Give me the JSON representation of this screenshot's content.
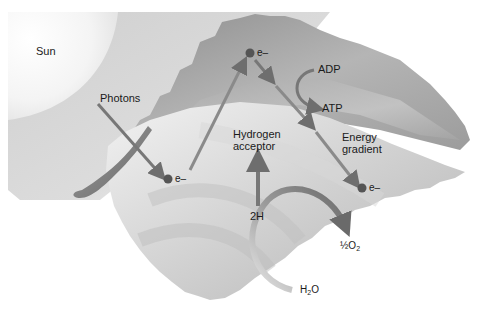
{
  "diagram": {
    "labels": {
      "sun": "Sun",
      "photons": "Photons",
      "electron": "e–",
      "adp": "ADP",
      "atp": "ATP",
      "hydrogen_acceptor_line1": "Hydrogen",
      "hydrogen_acceptor_line2": "acceptor",
      "energy_gradient_line1": "Energy",
      "energy_gradient_line2": "gradient",
      "two_h": "2H",
      "half_o2_prefix": "½O",
      "half_o2_sub": "2",
      "h2o_prefix": "H",
      "h2o_sub": "2",
      "h2o_suffix": "O"
    },
    "electrons": [
      {
        "id": "low",
        "x": 168,
        "y": 179
      },
      {
        "id": "high",
        "x": 250,
        "y": 53
      },
      {
        "id": "end",
        "x": 362,
        "y": 188
      }
    ],
    "colors": {
      "arrow": "#6e6e6e",
      "electron": "#555555",
      "leaf_dark": "#9a9a9a",
      "leaf_light": "#e8e8e8",
      "sun_bg": "#d4d4d4"
    }
  }
}
